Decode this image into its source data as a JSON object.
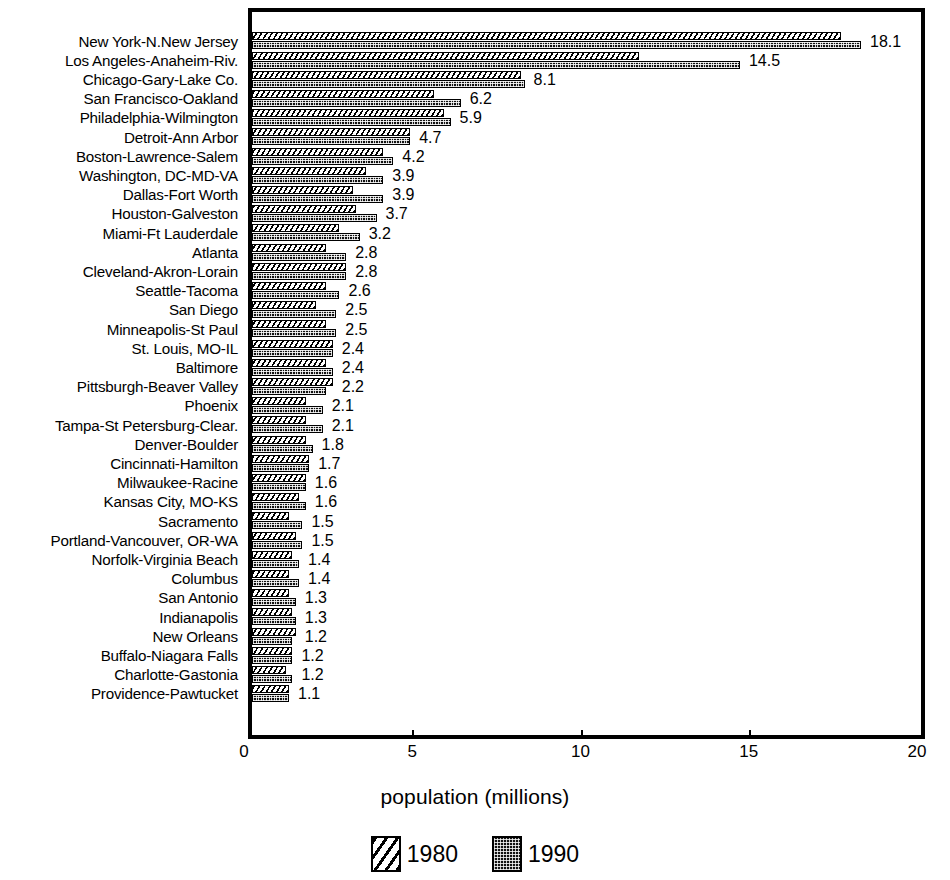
{
  "chart_data": {
    "type": "bar",
    "orientation": "horizontal",
    "title": "",
    "xlabel": "population (millions)",
    "ylabel": "",
    "xlim": [
      0,
      20
    ],
    "xticks": [
      0,
      5,
      10,
      15,
      20
    ],
    "xtick_labels": [
      "0",
      "5",
      "10",
      "15",
      "20"
    ],
    "grid": false,
    "legend_position": "bottom-center",
    "value_labels_series": "1990",
    "categories": [
      "New York-N.New Jersey",
      "Los Angeles-Anaheim-Riv.",
      "Chicago-Gary-Lake Co.",
      "San Francisco-Oakland",
      "Philadelphia-Wilmington",
      "Detroit-Ann Arbor",
      "Boston-Lawrence-Salem",
      "Washington, DC-MD-VA",
      "Dallas-Fort Worth",
      "Houston-Galveston",
      "Miami-Ft Lauderdale",
      "Atlanta",
      "Cleveland-Akron-Lorain",
      "Seattle-Tacoma",
      "San Diego",
      "Minneapolis-St Paul",
      "St. Louis, MO-IL",
      "Baltimore",
      "Pittsburgh-Beaver Valley",
      "Phoenix",
      "Tampa-St Petersburg-Clear.",
      "Denver-Boulder",
      "Cincinnati-Hamilton",
      "Milwaukee-Racine",
      "Kansas City, MO-KS",
      "Sacramento",
      "Portland-Vancouver, OR-WA",
      "Norfolk-Virginia Beach",
      "Columbus",
      "San Antonio",
      "Indianapolis",
      "New Orleans",
      "Buffalo-Niagara Falls",
      "Charlotte-Gastonia",
      "Providence-Pawtucket"
    ],
    "series": [
      {
        "name": "1980",
        "color": "#ffffff",
        "pattern": "diagonal-hatch",
        "values": [
          17.5,
          11.5,
          8.0,
          5.4,
          5.7,
          4.7,
          3.9,
          3.4,
          3.0,
          3.1,
          2.6,
          2.2,
          2.8,
          2.2,
          1.9,
          2.2,
          2.4,
          2.2,
          2.4,
          1.6,
          1.6,
          1.6,
          1.7,
          1.6,
          1.4,
          1.1,
          1.3,
          1.2,
          1.1,
          1.1,
          1.2,
          1.3,
          1.2,
          1.0,
          1.1
        ]
      },
      {
        "name": "1990",
        "color": "#111111",
        "pattern": "dotted-fill",
        "values": [
          18.1,
          14.5,
          8.1,
          6.2,
          5.9,
          4.7,
          4.2,
          3.9,
          3.9,
          3.7,
          3.2,
          2.8,
          2.8,
          2.6,
          2.5,
          2.5,
          2.4,
          2.4,
          2.2,
          2.1,
          2.1,
          1.8,
          1.7,
          1.6,
          1.6,
          1.5,
          1.5,
          1.4,
          1.4,
          1.3,
          1.3,
          1.2,
          1.2,
          1.2,
          1.1
        ]
      }
    ],
    "value_labels": [
      "18.1",
      "14.5",
      "8.1",
      "6.2",
      "5.9",
      "4.7",
      "4.2",
      "3.9",
      "3.9",
      "3.7",
      "3.2",
      "2.8",
      "2.8",
      "2.6",
      "2.5",
      "2.5",
      "2.4",
      "2.4",
      "2.2",
      "2.1",
      "2.1",
      "1.8",
      "1.7",
      "1.6",
      "1.6",
      "1.5",
      "1.5",
      "1.4",
      "1.4",
      "1.3",
      "1.3",
      "1.2",
      "1.2",
      "1.2",
      "1.1"
    ]
  },
  "legend": {
    "items": [
      {
        "label": "1980",
        "swatch": "hatched-swatch"
      },
      {
        "label": "1990",
        "swatch": "dotted-swatch"
      }
    ]
  },
  "axis": {
    "x_title": "population (millions)",
    "tick_labels": [
      "0",
      "5",
      "10",
      "15",
      "20"
    ]
  }
}
